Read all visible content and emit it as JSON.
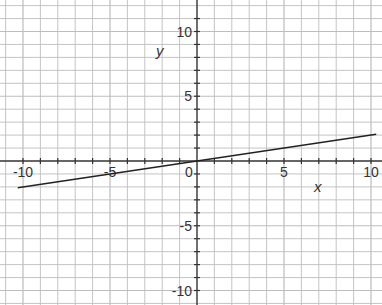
{
  "chart_data": {
    "type": "line",
    "title": "",
    "xlabel": "x",
    "ylabel": "y",
    "xlim": [
      -11,
      10.6
    ],
    "ylim": [
      -11,
      12.4
    ],
    "xticks": [
      -10,
      -5,
      0,
      5,
      10
    ],
    "yticks": [
      -10,
      -5,
      5,
      10
    ],
    "xtick_labels": [
      "-10",
      "-5",
      "0",
      "5",
      "10"
    ],
    "ytick_labels": [
      "-10",
      "-5",
      "5",
      "10"
    ],
    "grid": true,
    "grid_step": 1,
    "series": [
      {
        "name": "line",
        "equation": "y = 0.2x",
        "x": [
          -10.3,
          10.3
        ],
        "y": [
          -2.06,
          2.06
        ]
      }
    ]
  },
  "layout": {
    "origin_px": [
      197,
      161
    ],
    "x_unit_px": 17.4,
    "y_unit_px": 12.95,
    "grid_color": "#bdbdbd",
    "axis_color": "#333333",
    "line_color": "#222222"
  }
}
